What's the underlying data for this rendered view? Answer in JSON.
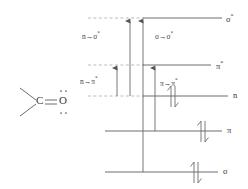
{
  "figure": {
    "type": "molecular-orbital-energy-level-diagram"
  },
  "structure": {
    "carbon_label": "C",
    "oxygen_label": "O",
    "bond": "double-bond",
    "lone_pair_dots_top": "••",
    "lone_pair_dots_bottom": "••"
  },
  "levels": [
    {
      "id": "sigma-star",
      "label": "σ",
      "superscript": "*",
      "y": 18,
      "x_start": 143,
      "x_end": 222,
      "dashed_extension": {
        "x_start": 88,
        "x_end": 143
      },
      "electrons": null
    },
    {
      "id": "pi-star",
      "label": "π",
      "superscript": "*",
      "y": 65,
      "x_start": 143,
      "x_end": 211,
      "dashed_extension": {
        "x_start": 88,
        "x_end": 143
      },
      "electrons": null
    },
    {
      "id": "n",
      "label": "n",
      "superscript": "",
      "y": 96,
      "x_start": 143,
      "x_end": 228,
      "dashed_extension": {
        "x_start": 88,
        "x_end": 143
      },
      "electrons": "pair"
    },
    {
      "id": "pi",
      "label": "π",
      "superscript": "",
      "y": 131,
      "x_start": 105,
      "x_end": 222,
      "dashed_extension": null,
      "electrons": "pair"
    },
    {
      "id": "sigma",
      "label": "σ",
      "superscript": "",
      "y": 172,
      "x_start": 105,
      "x_end": 218,
      "dashed_extension": null,
      "electrons": "pair"
    }
  ],
  "transitions": [
    {
      "id": "n-to-sigma-star",
      "label": "n",
      "arrow": "→",
      "target": "σ",
      "target_sup": "*",
      "x": 130,
      "y_from": 96,
      "y_to": 18,
      "label_x": 82,
      "label_y": 31
    },
    {
      "id": "sigma-to-sigma-star",
      "label": "σ",
      "arrow": "→",
      "target": "σ",
      "target_sup": "*",
      "x": 143,
      "y_from": 172,
      "y_to": 18,
      "label_x": 155,
      "label_y": 31
    },
    {
      "id": "n-to-pi-star",
      "label": "n",
      "arrow": "→",
      "target": "π",
      "target_sup": "*",
      "x": 117,
      "y_from": 96,
      "y_to": 65,
      "label_x": 80,
      "label_y": 76
    },
    {
      "id": "pi-to-pi-star",
      "label": "π",
      "arrow": "→",
      "target": "π",
      "target_sup": "*",
      "x": 155,
      "y_from": 131,
      "y_to": 65,
      "label_x": 152,
      "label_y": 78
    }
  ],
  "colors": {
    "line": "#6e6e6e",
    "dashed": "#b0b0b0",
    "arrow": "#555555",
    "text": "#3a3a3a",
    "background": "#ffffff"
  }
}
